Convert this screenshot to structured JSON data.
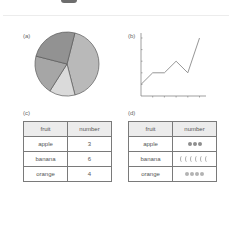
{
  "panels": {
    "a": {
      "label": "(a)"
    },
    "b": {
      "label": "(b)"
    },
    "c": {
      "label": "(c)"
    },
    "d": {
      "label": "(d)"
    }
  },
  "table_c": {
    "headers": [
      "fruit",
      "number"
    ],
    "rows": [
      {
        "fruit": "apple",
        "number": "3"
      },
      {
        "fruit": "banana",
        "number": "6"
      },
      {
        "fruit": "orange",
        "number": "4"
      }
    ]
  },
  "table_d": {
    "headers": [
      "fruit",
      "number"
    ],
    "rows": [
      {
        "fruit": "apple",
        "icon": "apple-icon",
        "count": 3
      },
      {
        "fruit": "banana",
        "icon": "banana-icon",
        "count": 6
      },
      {
        "fruit": "orange",
        "icon": "orange-icon",
        "count": 4
      }
    ]
  },
  "chart_data": [
    {
      "type": "pie",
      "title": "(a)",
      "slices": [
        {
          "label": "slice-1",
          "value": 42,
          "color": "#b9b9b9"
        },
        {
          "label": "slice-2",
          "value": 13,
          "color": "#dadada"
        },
        {
          "label": "slice-3",
          "value": 20,
          "color": "#a6a6a6"
        },
        {
          "label": "slice-4",
          "value": 25,
          "color": "#929292"
        }
      ]
    },
    {
      "type": "line",
      "title": "(b)",
      "x": [
        0,
        1,
        2,
        3,
        4,
        5
      ],
      "values": [
        1,
        2,
        2,
        3,
        2,
        5
      ],
      "xlabel": "",
      "ylabel": "",
      "ylim": [
        0,
        5
      ],
      "grid": false,
      "color": "#8a8a8a"
    }
  ]
}
